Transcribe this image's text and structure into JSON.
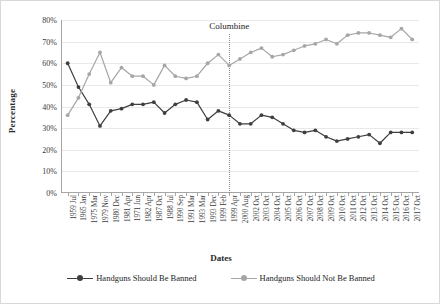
{
  "chart_data": {
    "type": "line",
    "title": "",
    "xlabel": "Dates",
    "ylabel": "Percentage",
    "ylim": [
      0,
      80
    ],
    "ytick_labels": [
      "80%",
      "70%",
      "60%",
      "50%",
      "40%",
      "30%",
      "20%",
      "10%",
      "0%"
    ],
    "ytick_values": [
      80,
      70,
      60,
      50,
      40,
      30,
      20,
      10,
      0
    ],
    "grid": true,
    "legend_position": "bottom",
    "categories": [
      "1959 Jul",
      "1965 Jan",
      "1975 Mar",
      "1979 Nov",
      "1980 Dec",
      "1981 Apr",
      "1971 Jun",
      "1982 Apr",
      "1987 Oct",
      "1988 Jul",
      "1990 Sep",
      "1991 Mar",
      "1993 Mar",
      "1993 Dec",
      "1999 Feb",
      "1999 Apr",
      "2000 Aug",
      "2002 Oct",
      "2003 Oct",
      "2004 Oct",
      "2005 Oct",
      "2006 Oct",
      "2007 Oct",
      "2008 Oct",
      "2009 Oct",
      "2010 Oct",
      "2011 Oct",
      "2012 Oct",
      "2013 Oct",
      "2014 Oct",
      "2015 Oct",
      "2016 Oct",
      "2017 Oct"
    ],
    "series": [
      {
        "name": "Handguns Should Be Banned",
        "color": "#3f3f3f",
        "values": [
          60,
          49,
          41,
          31,
          38,
          39,
          41,
          41,
          42,
          37,
          41,
          43,
          42,
          34,
          38,
          36,
          32,
          32,
          36,
          35,
          32,
          29,
          28,
          29,
          26,
          24,
          25,
          26,
          27,
          23,
          28,
          28,
          28
        ]
      },
      {
        "name": "Handguns Should Not Be Banned",
        "color": "#a6a6a6",
        "values": [
          36,
          44,
          55,
          65,
          51,
          58,
          54,
          54,
          50,
          59,
          54,
          53,
          54,
          60,
          64,
          59,
          62,
          65,
          67,
          63,
          64,
          66,
          68,
          69,
          71,
          69,
          73,
          74,
          74,
          73,
          72,
          76,
          71
        ]
      }
    ],
    "annotations": [
      {
        "label": "Columbine",
        "category_index": 15,
        "type": "vertical-dotted-line"
      }
    ]
  },
  "legend": {
    "items": [
      {
        "label": "Handguns Should Be Banned"
      },
      {
        "label": "Handguns Should Not Be Banned"
      }
    ]
  }
}
